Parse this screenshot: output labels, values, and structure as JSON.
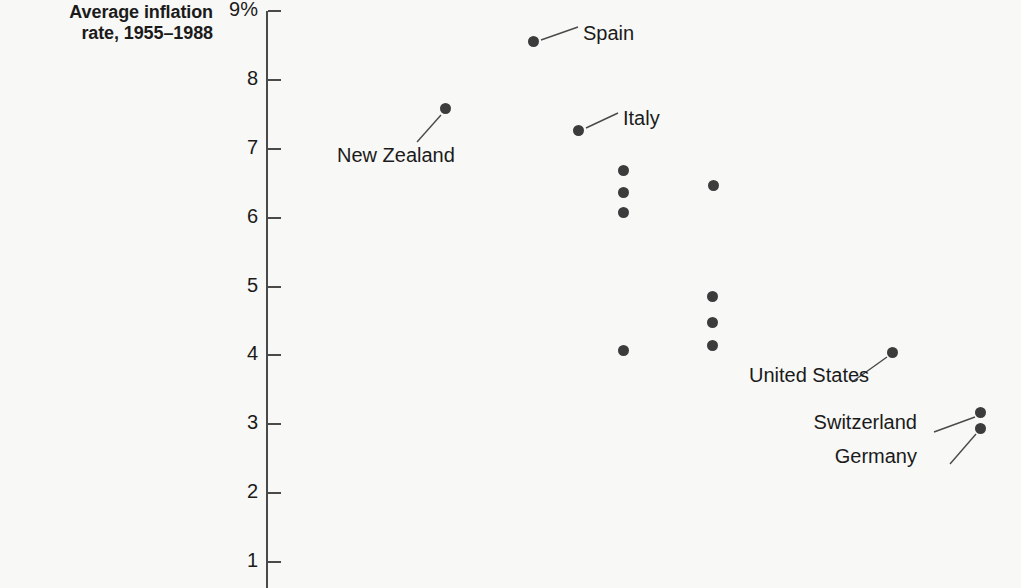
{
  "title": {
    "line1": "Average inflation",
    "line2": "rate, 1955–1988"
  },
  "axis": {
    "ticks": [
      {
        "label": "9%",
        "value": 9
      },
      {
        "label": "8",
        "value": 8
      },
      {
        "label": "7",
        "value": 7
      },
      {
        "label": "6",
        "value": 6
      },
      {
        "label": "5",
        "value": 5
      },
      {
        "label": "4",
        "value": 4
      },
      {
        "label": "3",
        "value": 3
      },
      {
        "label": "2",
        "value": 2
      },
      {
        "label": "1",
        "value": 1
      }
    ]
  },
  "labels": {
    "spain": "Spain",
    "new_zealand": "New Zealand",
    "italy": "Italy",
    "united_states": "United States",
    "switzerland": "Switzerland",
    "germany": "Germany"
  },
  "colors": {
    "background": "#f8f8f6",
    "point": "#3c3c3c",
    "axis": "#4a4a4a",
    "text": "#1b1b1b"
  },
  "chart_data": {
    "type": "scatter",
    "title": "Average inflation rate, 1955–1988",
    "xlabel": "",
    "ylabel": "Average inflation rate, 1955–1988",
    "ylim": [
      1,
      9
    ],
    "yticks": [
      1,
      2,
      3,
      4,
      5,
      6,
      7,
      8,
      9
    ],
    "ytick_labels": [
      "1",
      "2",
      "3",
      "4",
      "5",
      "6",
      "7",
      "8",
      "9%"
    ],
    "grid": false,
    "legend": "none",
    "axis_visible": "y-only",
    "points": [
      {
        "label": "Spain",
        "x_px": 533,
        "y": 8.55,
        "annotated": true
      },
      {
        "label": "New Zealand",
        "x_px": 445,
        "y": 7.58,
        "annotated": true
      },
      {
        "label": "Italy",
        "x_px": 578,
        "y": 7.26,
        "annotated": true
      },
      {
        "label": "",
        "x_px": 623,
        "y": 6.69,
        "annotated": false
      },
      {
        "label": "",
        "x_px": 623,
        "y": 6.36,
        "annotated": false
      },
      {
        "label": "",
        "x_px": 623,
        "y": 6.07,
        "annotated": false
      },
      {
        "label": "",
        "x_px": 713,
        "y": 6.47,
        "annotated": false
      },
      {
        "label": "",
        "x_px": 712,
        "y": 4.86,
        "annotated": false
      },
      {
        "label": "",
        "x_px": 712,
        "y": 4.48,
        "annotated": false
      },
      {
        "label": "",
        "x_px": 712,
        "y": 4.15,
        "annotated": false
      },
      {
        "label": "",
        "x_px": 623,
        "y": 4.07,
        "annotated": false
      },
      {
        "label": "United States",
        "x_px": 892,
        "y": 4.04,
        "annotated": true
      },
      {
        "label": "Switzerland",
        "x_px": 980,
        "y": 3.17,
        "annotated": true
      },
      {
        "label": "Germany",
        "x_px": 980,
        "y": 2.94,
        "annotated": true
      }
    ]
  }
}
